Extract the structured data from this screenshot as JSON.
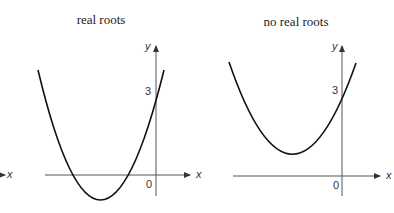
{
  "panels": [
    {
      "title": "real roots",
      "x_axis_label": "x",
      "y_axis_label": "y",
      "y_intercept_label": "3",
      "origin_label": "0"
    },
    {
      "title": "no real roots",
      "x_axis_label": "x",
      "y_axis_label": "y",
      "y_intercept_label": "3",
      "origin_label": "0"
    }
  ],
  "edge_label": "x",
  "colors": {
    "curve": "#111111",
    "axis": "#555555"
  }
}
